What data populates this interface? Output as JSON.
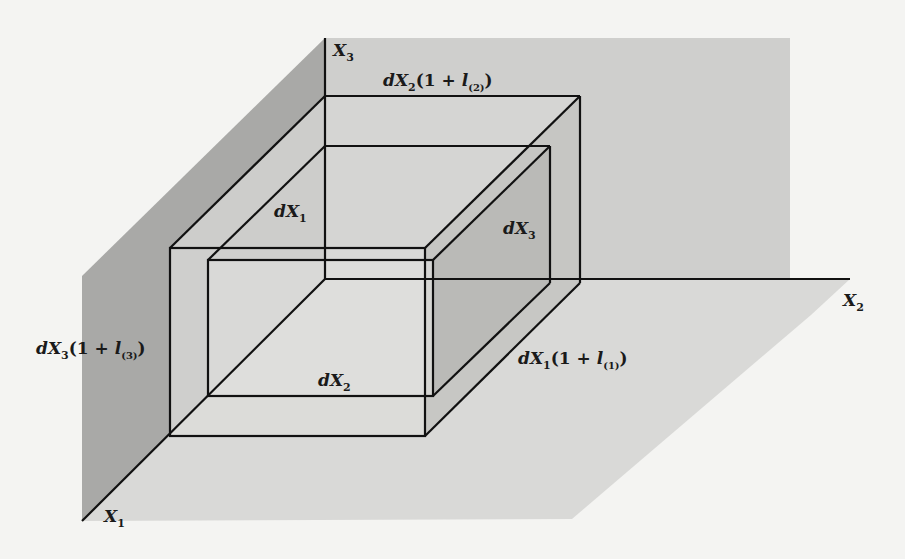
{
  "figure": {
    "colors": {
      "page_background": "#f4f4f2",
      "left_plane": "#a9a9a7",
      "back_plane": "#cfcfcd",
      "floor_plane": "#d9d9d7",
      "box_face": "#dedede",
      "box_side_face": "#bcbcba",
      "line": "#111111"
    },
    "axes": {
      "x1": {
        "name": "X",
        "sub": "1"
      },
      "x2": {
        "name": "X",
        "sub": "2"
      },
      "x3": {
        "name": "X",
        "sub": "3"
      }
    },
    "labels": {
      "dX1": {
        "d": "dX",
        "sub": "1"
      },
      "dX2": {
        "d": "dX",
        "sub": "2"
      },
      "dX3": {
        "d": "dX",
        "sub": "3"
      },
      "dX1_deformed": {
        "d": "dX",
        "sub": "1",
        "open": "(1 + ",
        "l": "l",
        "lsub": "(1)",
        "close": ")"
      },
      "dX2_deformed": {
        "d": "dX",
        "sub": "2",
        "open": "(1 + ",
        "l": "l",
        "lsub": "(2)",
        "close": ")"
      },
      "dX3_deformed": {
        "d": "dX",
        "sub": "3",
        "open": "(1 + ",
        "l": "l",
        "lsub": "(3)",
        "close": ")"
      }
    }
  }
}
